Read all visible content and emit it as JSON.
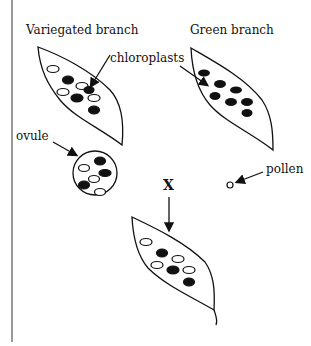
{
  "labels": {
    "variegated": "Variegated branch",
    "green": "Green branch",
    "chloroplasts": "chloroplasts",
    "ovule": "ovule",
    "pollen": "pollen",
    "cross": "X"
  },
  "colors": {
    "ink": "#111111",
    "background": "#ffffff"
  },
  "leaves": {
    "variegated": {
      "filled": 4,
      "open": 4
    },
    "green": {
      "filled": 7,
      "open": 0
    },
    "ovule": {
      "filled": 3,
      "open": 3
    },
    "offspring": {
      "filled": 3,
      "open": 4
    }
  }
}
